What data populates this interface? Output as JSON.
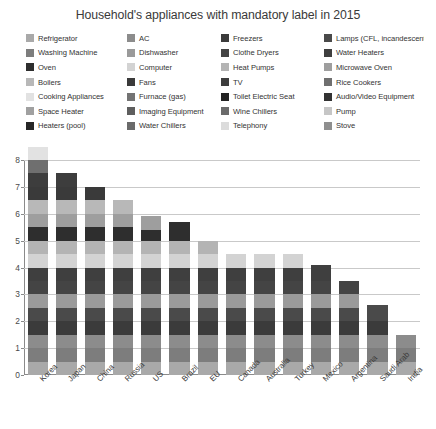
{
  "chart": {
    "title": "Household's appliances with mandatory label in 2015"
  },
  "legend": {
    "items": [
      {
        "label": "Refrigerator",
        "color": "#a9a9a9"
      },
      {
        "label": "AC",
        "color": "#8c8c8c"
      },
      {
        "label": "Freezers",
        "color": "#3b3b3b"
      },
      {
        "label": "Lamps (CFL, incandescent)",
        "color": "#4a4a4a"
      },
      {
        "label": "Washing Machine",
        "color": "#7d7d7d"
      },
      {
        "label": "Dishwasher",
        "color": "#9a9a9a"
      },
      {
        "label": "Clothe Dryers",
        "color": "#444444"
      },
      {
        "label": "Water Heaters",
        "color": "#3f3f3f"
      },
      {
        "label": "Oven",
        "color": "#2e2e2e"
      },
      {
        "label": "Computer",
        "color": "#d3d3d3"
      },
      {
        "label": "Heat Pumps",
        "color": "#b4b4b4"
      },
      {
        "label": "Microwave Oven",
        "color": "#9e9e9e"
      },
      {
        "label": "Boilers",
        "color": "#b8b8b8"
      },
      {
        "label": "Fans",
        "color": "#3a3a3a"
      },
      {
        "label": "TV",
        "color": "#3d3d3d"
      },
      {
        "label": "Rice Cookers",
        "color": "#6f6f6f"
      },
      {
        "label": "Cooking Appliances",
        "color": "#e2e2e2"
      },
      {
        "label": "Furnace (gas)",
        "color": "#737373"
      },
      {
        "label": "Toilet Electric Seat",
        "color": "#232323"
      },
      {
        "label": "Audio/Video Equipment",
        "color": "#333333"
      },
      {
        "label": "Space Heater",
        "color": "#a0a0a0"
      },
      {
        "label": "Imaging Equipment",
        "color": "#5e5e5e"
      },
      {
        "label": "Wine Chillers",
        "color": "#6b6b6b"
      },
      {
        "label": "Pump",
        "color": "#c6c6c6"
      },
      {
        "label": "Heaters (pool)",
        "color": "#262626"
      },
      {
        "label": "Water Chillers",
        "color": "#6a6a6a"
      },
      {
        "label": "Telephony",
        "color": "#dcdcdc"
      },
      {
        "label": "Stove",
        "color": "#8f8f8f"
      }
    ]
  },
  "chart_data": {
    "type": "bar",
    "title": "Household's appliances with mandatory label in 2015",
    "xlabel": "",
    "ylabel": "",
    "ylim": [
      0,
      8
    ],
    "yticks": [
      0,
      1,
      2,
      3,
      4,
      5,
      6,
      7,
      8
    ],
    "grid": true,
    "legend_position": "top",
    "stacked": true,
    "categories": [
      "Korea",
      "Japan",
      "China",
      "Russia",
      "US",
      "Brazil",
      "EU",
      "Canada",
      "Australia",
      "Turkey",
      "Mexico",
      "Argentina",
      "Saudi Arab",
      "India"
    ],
    "totals": [
      8,
      6.5,
      6,
      6,
      5.4,
      5.7,
      4.5,
      4,
      4,
      4,
      3.6,
      3,
      2.6,
      1.5
    ],
    "series": [
      {
        "name": "Refrigerator",
        "color": "#a9a9a9",
        "values": [
          0.5,
          0.5,
          0.5,
          0.5,
          0.5,
          0.5,
          0.5,
          0.5,
          0.5,
          0.5,
          0.5,
          0.5,
          0.5,
          0.5
        ]
      },
      {
        "name": "Washing Machine",
        "color": "#7d7d7d",
        "values": [
          0.5,
          0.5,
          0.5,
          0.5,
          0.5,
          0.5,
          0.5,
          0.5,
          0.5,
          0.5,
          0.5,
          0.5,
          0.5,
          0.5
        ]
      },
      {
        "name": "AC",
        "color": "#8c8c8c",
        "values": [
          0.5,
          0.5,
          0.5,
          0.5,
          0.5,
          0.5,
          0.5,
          0.5,
          0.5,
          0.5,
          0.5,
          0.5,
          0.5,
          0.5
        ]
      },
      {
        "name": "Freezers",
        "color": "#3b3b3b",
        "values": [
          0.5,
          0.5,
          0.5,
          0.5,
          0.5,
          0.5,
          0.5,
          0.5,
          0.5,
          0.5,
          0.5,
          0.5,
          0.5,
          0
        ]
      },
      {
        "name": "Lamps (CFL, incandescent)",
        "color": "#4a4a4a",
        "values": [
          0.5,
          0.5,
          0.5,
          0.5,
          0.5,
          0.5,
          0.5,
          0.5,
          0.5,
          0.5,
          0.5,
          0.5,
          0.6,
          0
        ]
      },
      {
        "name": "Dishwasher",
        "color": "#9a9a9a",
        "values": [
          0.5,
          0.5,
          0.5,
          0.5,
          0.5,
          0.5,
          0.5,
          0.5,
          0.5,
          0.5,
          0.5,
          0.5,
          0,
          0
        ]
      },
      {
        "name": "Clothe Dryers",
        "color": "#444444",
        "values": [
          0.5,
          0.5,
          0.5,
          0.5,
          0.5,
          0.5,
          0.5,
          0.5,
          0.5,
          0.5,
          0.5,
          0.5,
          0,
          0
        ]
      },
      {
        "name": "Water Heaters",
        "color": "#3f3f3f",
        "values": [
          0.5,
          0.5,
          0.5,
          0.5,
          0.5,
          0.5,
          0.5,
          0.5,
          0.5,
          0.5,
          0.6,
          0,
          0,
          0
        ]
      },
      {
        "name": "Computer",
        "color": "#d3d3d3",
        "values": [
          0.5,
          0.5,
          0.5,
          0.5,
          0.5,
          0.5,
          0.5,
          0.5,
          0.5,
          0.5,
          0,
          0,
          0,
          0
        ]
      },
      {
        "name": "Heat Pumps",
        "color": "#b4b4b4",
        "values": [
          0.5,
          0.5,
          0.5,
          0.5,
          0.5,
          0.5,
          0.5,
          0,
          0,
          0,
          0,
          0,
          0,
          0
        ]
      },
      {
        "name": "Oven",
        "color": "#2e2e2e",
        "values": [
          0.5,
          0.5,
          0.5,
          0.5,
          0.4,
          0.7,
          0,
          0,
          0,
          0,
          0,
          0,
          0,
          0
        ]
      },
      {
        "name": "Microwave Oven",
        "color": "#9e9e9e",
        "values": [
          0.5,
          0.5,
          0.5,
          0.5,
          0.5,
          0,
          0,
          0,
          0,
          0,
          0,
          0,
          0,
          0
        ]
      },
      {
        "name": "Boilers",
        "color": "#b8b8b8",
        "values": [
          0.5,
          0.5,
          0.5,
          0.5,
          0,
          0,
          0,
          0,
          0,
          0,
          0,
          0,
          0,
          0
        ]
      },
      {
        "name": "Fans",
        "color": "#3a3a3a",
        "values": [
          0.5,
          0.5,
          0.5,
          0,
          0,
          0,
          0,
          0,
          0,
          0,
          0,
          0,
          0,
          0
        ]
      },
      {
        "name": "TV",
        "color": "#3d3d3d",
        "values": [
          0.5,
          0.5,
          0,
          0,
          0,
          0,
          0,
          0,
          0,
          0,
          0,
          0,
          0,
          0
        ]
      },
      {
        "name": "Rice Cookers",
        "color": "#6f6f6f",
        "values": [
          0.5,
          0,
          0,
          0,
          0,
          0,
          0,
          0,
          0,
          0,
          0,
          0,
          0,
          0
        ]
      },
      {
        "name": "Cooking Appliances",
        "color": "#e2e2e2",
        "values": [
          0.5,
          0,
          0,
          0,
          0,
          0,
          0,
          0,
          0,
          0,
          0,
          0,
          0,
          0
        ]
      }
    ]
  }
}
